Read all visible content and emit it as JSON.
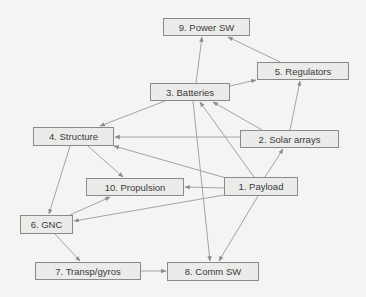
{
  "diagram": {
    "nodes": [
      {
        "id": "n9",
        "label": "9. Power SW",
        "x": 163,
        "y": 18,
        "w": 87,
        "h": 18
      },
      {
        "id": "n5",
        "label": "5. Regulators",
        "x": 257,
        "y": 62,
        "w": 92,
        "h": 18
      },
      {
        "id": "n3",
        "label": "3. Batteries",
        "x": 150,
        "y": 83,
        "w": 80,
        "h": 18
      },
      {
        "id": "n4",
        "label": "4. Structure",
        "x": 33,
        "y": 127,
        "w": 81,
        "h": 19
      },
      {
        "id": "n2",
        "label": "2. Solar arrays",
        "x": 240,
        "y": 130,
        "w": 99,
        "h": 18
      },
      {
        "id": "n10",
        "label": "10. Propulsion",
        "x": 86,
        "y": 178,
        "w": 98,
        "h": 18
      },
      {
        "id": "n1",
        "label": "1. Payload",
        "x": 224,
        "y": 177,
        "w": 74,
        "h": 19
      },
      {
        "id": "n6",
        "label": "6. GNC",
        "x": 20,
        "y": 215,
        "w": 53,
        "h": 19
      },
      {
        "id": "n7",
        "label": "7. Transp/gyros",
        "x": 35,
        "y": 262,
        "w": 106,
        "h": 18
      },
      {
        "id": "n8",
        "label": "8. Comm SW",
        "x": 167,
        "y": 262,
        "w": 92,
        "h": 19
      }
    ],
    "edges": [
      {
        "from": "3. Batteries",
        "to": "9. Power SW",
        "x1": 196,
        "y1": 83,
        "x2": 202,
        "y2": 37
      },
      {
        "from": "5. Regulators",
        "to": "9. Power SW",
        "x1": 280,
        "y1": 62,
        "x2": 228,
        "y2": 37
      },
      {
        "from": "3. Batteries",
        "to": "5. Regulators",
        "x1": 230,
        "y1": 86,
        "x2": 256,
        "y2": 80
      },
      {
        "from": "2. Solar arrays",
        "to": "5. Regulators",
        "x1": 290,
        "y1": 130,
        "x2": 300,
        "y2": 81
      },
      {
        "from": "3. Batteries",
        "to": "4. Structure",
        "x1": 165,
        "y1": 101,
        "x2": 100,
        "y2": 126
      },
      {
        "from": "2. Solar arrays",
        "to": "4. Structure",
        "x1": 240,
        "y1": 137,
        "x2": 115,
        "y2": 137
      },
      {
        "from": "1. Payload",
        "to": "4. Structure",
        "x1": 226,
        "y1": 178,
        "x2": 114,
        "y2": 146
      },
      {
        "from": "2. Solar arrays",
        "to": "3. Batteries",
        "x1": 262,
        "y1": 130,
        "x2": 213,
        "y2": 102
      },
      {
        "from": "1. Payload",
        "to": "3. Batteries",
        "x1": 254,
        "y1": 177,
        "x2": 200,
        "y2": 102
      },
      {
        "from": "1. Payload",
        "to": "2. Solar arrays",
        "x1": 265,
        "y1": 177,
        "x2": 283,
        "y2": 149
      },
      {
        "from": "3. Batteries",
        "to": "8. Comm SW",
        "x1": 193,
        "y1": 101,
        "x2": 210,
        "y2": 261
      },
      {
        "from": "1. Payload",
        "to": "8. Comm SW",
        "x1": 258,
        "y1": 196,
        "x2": 219,
        "y2": 261
      },
      {
        "from": "4. Structure",
        "to": "10. Propulsion",
        "x1": 88,
        "y1": 146,
        "x2": 123,
        "y2": 177
      },
      {
        "from": "1. Payload",
        "to": "10. Propulsion",
        "x1": 224,
        "y1": 188,
        "x2": 185,
        "y2": 187
      },
      {
        "from": "6. GNC",
        "to": "10. Propulsion",
        "x1": 70,
        "y1": 215,
        "x2": 110,
        "y2": 197
      },
      {
        "from": "1. Payload",
        "to": "6. GNC",
        "x1": 224,
        "y1": 195,
        "x2": 74,
        "y2": 221
      },
      {
        "from": "4. Structure",
        "to": "6. GNC",
        "x1": 70,
        "y1": 146,
        "x2": 49,
        "y2": 214
      },
      {
        "from": "6. GNC",
        "to": "7. Transp/gyros",
        "x1": 55,
        "y1": 234,
        "x2": 80,
        "y2": 261
      },
      {
        "from": "7. Transp/gyros",
        "to": "8. Comm SW",
        "x1": 141,
        "y1": 271,
        "x2": 166,
        "y2": 271
      }
    ],
    "colors": {
      "background": "#f4f4f2",
      "node_fill": "#ebebea",
      "node_border": "#8a8a88",
      "edge": "#9a9a98",
      "text": "#3a3a3a"
    }
  }
}
